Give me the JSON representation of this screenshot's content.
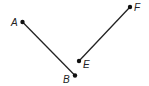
{
  "diagram": {
    "type": "line-segments",
    "color": "#222222",
    "points": [
      {
        "name": "A",
        "x": 22.5,
        "y": 22,
        "label_x": 11,
        "label_y": 26
      },
      {
        "name": "B",
        "x": 75,
        "y": 75.5,
        "label_x": 63,
        "label_y": 83
      },
      {
        "name": "E",
        "x": 79,
        "y": 61,
        "label_x": 83,
        "label_y": 68
      },
      {
        "name": "F",
        "x": 130,
        "y": 7,
        "label_x": 134,
        "label_y": 11
      }
    ],
    "segments": [
      {
        "name": "AB",
        "from": "A",
        "to": "B"
      },
      {
        "name": "EF",
        "from": "E",
        "to": "F"
      }
    ]
  }
}
